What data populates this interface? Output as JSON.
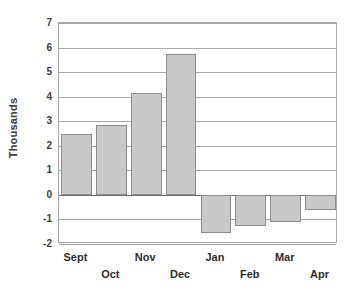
{
  "chart_data": {
    "type": "bar",
    "title": "",
    "xlabel": "",
    "ylabel": "Thousands",
    "categories": [
      "Sept",
      "Oct",
      "Nov",
      "Dec",
      "Jan",
      "Feb",
      "Mar",
      "Apr"
    ],
    "values": [
      2.5,
      2.85,
      4.15,
      5.75,
      -1.55,
      -1.25,
      -1.1,
      -0.6
    ],
    "ylim": [
      -2,
      7
    ],
    "y_ticks": [
      7,
      6,
      5,
      4,
      3,
      2,
      1,
      0,
      -1,
      -2
    ],
    "y_tick_labels": [
      "7",
      "6",
      "5",
      "4",
      "3",
      "2",
      "1",
      "0",
      "-1",
      "-2"
    ],
    "grid": true,
    "legend": false,
    "legend_position": "none",
    "x_label_stagger": true,
    "series": [
      {
        "name": "",
        "values": [
          2.5,
          2.85,
          4.15,
          5.75,
          -1.55,
          -1.25,
          -1.1,
          -0.6
        ]
      }
    ]
  },
  "style": {
    "bar_fill": "#c9c9c9",
    "bar_border": "#8d8d8d",
    "gridline_color": "#a8a8a8",
    "zero_line_color": "#6e6e6e",
    "text_color": "#2e2e2e",
    "background": "#ffffff"
  }
}
